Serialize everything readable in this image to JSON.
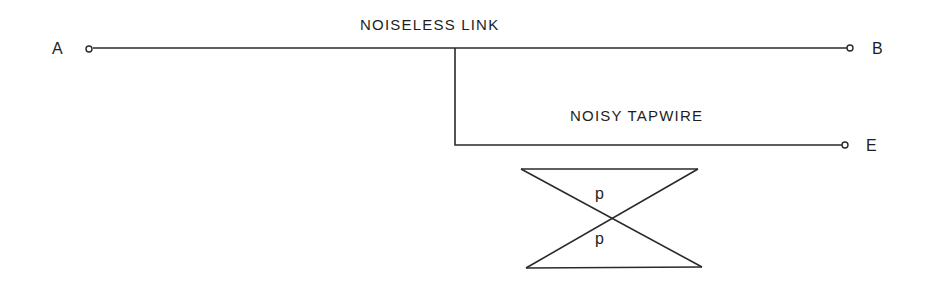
{
  "diagram": {
    "links": {
      "noiseless": {
        "label": "NOISELESS LINK"
      },
      "noisy": {
        "label": "NOISY TAPWIRE"
      }
    },
    "nodes": {
      "a": {
        "label": "A"
      },
      "b": {
        "label": "B"
      },
      "e": {
        "label": "E"
      }
    },
    "channel": {
      "top_probability": "p",
      "bottom_probability": "p"
    },
    "colors": {
      "ink": "#2a2a2a",
      "background": "#ffffff"
    }
  }
}
